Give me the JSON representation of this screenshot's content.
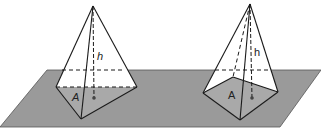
{
  "figure": {
    "colors": {
      "plane": "#9a9a9a",
      "base_face": "#a9a9a9",
      "line": "#1a1a1a",
      "background": "#ffffff"
    },
    "left_pyramid": {
      "base_shape": "triangle",
      "height_label": "h",
      "area_label": "A"
    },
    "right_pyramid": {
      "base_shape": "quadrilateral",
      "height_label": "h",
      "area_label": "A"
    }
  }
}
